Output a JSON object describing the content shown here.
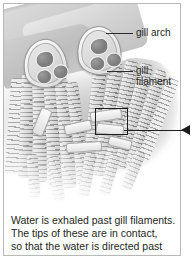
{
  "figure": {
    "alt_title": "Fish gill structure diagram",
    "labels": [
      {
        "id": "gill-arch",
        "text": "gill arch"
      },
      {
        "id": "gill-filament-line1",
        "text": "gill"
      },
      {
        "id": "gill-filament-line2",
        "text": "filament"
      }
    ],
    "callout": {
      "name": "magnified-region-pointer",
      "direction": "left-arrow"
    }
  },
  "caption": {
    "line1": "Water is exhaled past gill filaments.",
    "line2": "The tips of these are in contact,",
    "line3": "so that the water is directed past"
  },
  "colors": {
    "ink": "#231f20",
    "leader": "#1d1d1d",
    "frame": "#b9b9b9",
    "tissue_mid": "#c6c6c6",
    "tissue_dark": "#7b7b7b",
    "page": "#ffffff"
  }
}
